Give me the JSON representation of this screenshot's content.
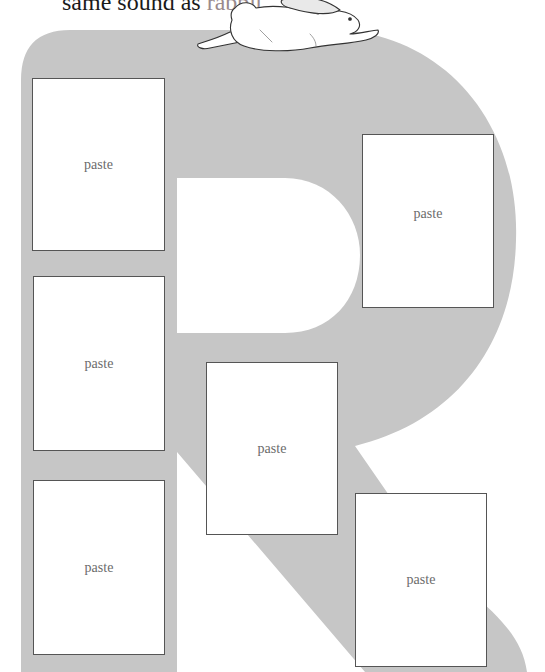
{
  "header": {
    "text_prefix": "same sound as ",
    "highlight_word": "rabbit",
    "text_suffix": ".",
    "highlight_color": "#9a8a8c"
  },
  "illustration": {
    "letter": "R",
    "letter_fill_color": "#c6c6c6",
    "decoration": "rabbit-drawing"
  },
  "paste_boxes": [
    {
      "label": "paste",
      "position": "stem-top"
    },
    {
      "label": "paste",
      "position": "stem-middle"
    },
    {
      "label": "paste",
      "position": "stem-bottom"
    },
    {
      "label": "paste",
      "position": "bowl-right"
    },
    {
      "label": "paste",
      "position": "center"
    },
    {
      "label": "paste",
      "position": "leg-bottom-right"
    }
  ]
}
